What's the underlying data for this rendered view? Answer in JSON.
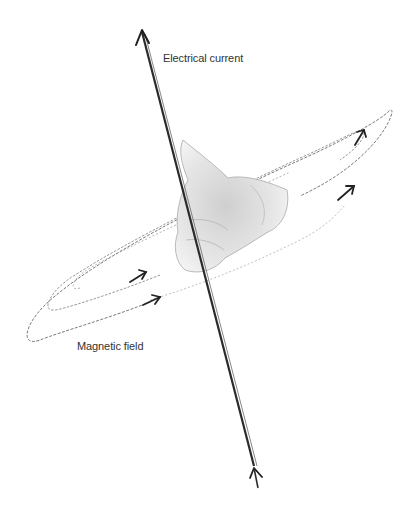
{
  "diagram": {
    "labels": {
      "current": "Electrical current",
      "field": "Magnetic field"
    },
    "colors": {
      "background": "#ffffff",
      "wire": "#2a2a2a",
      "field_lines": "#7a7a7a",
      "arrows": "#222222",
      "hand": "#b8b8b8",
      "text": "#333333"
    }
  }
}
